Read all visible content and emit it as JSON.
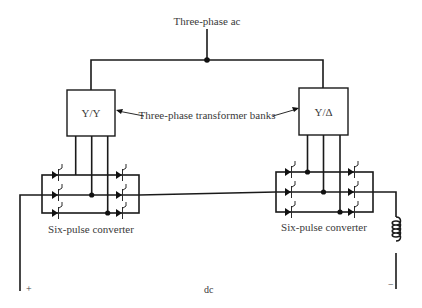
{
  "diagram": {
    "labels": {
      "ac_source": "Three-phase ac",
      "transformer_banks": "Three-phase transformer banks",
      "transformer_left": "Y/Y",
      "transformer_right": "Y/Δ",
      "converter_left": "Six-pulse converter",
      "converter_right": "Six-pulse converter",
      "dc": "dc",
      "plus": "+",
      "minus": "−"
    },
    "components": [
      {
        "id": "ac-source",
        "type": "source",
        "label": "Three-phase ac"
      },
      {
        "id": "transformer-yy",
        "type": "transformer",
        "label": "Y/Y"
      },
      {
        "id": "transformer-yd",
        "type": "transformer",
        "label": "Y/Δ"
      },
      {
        "id": "converter-left",
        "type": "six-pulse-thyristor-bridge",
        "thyristors": 6
      },
      {
        "id": "converter-right",
        "type": "six-pulse-thyristor-bridge",
        "thyristors": 6
      },
      {
        "id": "smoothing-inductor",
        "type": "inductor"
      }
    ],
    "connections": [
      [
        "ac-source",
        "transformer-yy"
      ],
      [
        "ac-source",
        "transformer-yd"
      ],
      [
        "transformer-yy",
        "converter-left"
      ],
      [
        "transformer-yd",
        "converter-right"
      ],
      [
        "converter-left",
        "converter-right"
      ],
      [
        "converter-right",
        "smoothing-inductor"
      ]
    ]
  }
}
